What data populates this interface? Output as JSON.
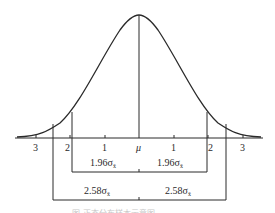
{
  "diagram": {
    "type": "normal-distribution-confidence-intervals",
    "center_label": "μ",
    "axis_ticks_left": [
      "3",
      "2",
      "1"
    ],
    "axis_ticks_right": [
      "1",
      "2",
      "3"
    ],
    "intervals": [
      {
        "name": "95%",
        "multiplier": "1.96",
        "left_label": "1.96σ",
        "right_label": "1.96σ",
        "subscript": "x̄"
      },
      {
        "name": "99%",
        "multiplier": "2.58",
        "left_label": "2.58σ",
        "right_label": "2.58σ",
        "subscript": "x̄"
      }
    ],
    "caption": "图 正态分布样本示意图",
    "colors": {
      "line": "#2a2a2a",
      "background": "#ffffff",
      "caption": "#c8c8c8"
    }
  }
}
